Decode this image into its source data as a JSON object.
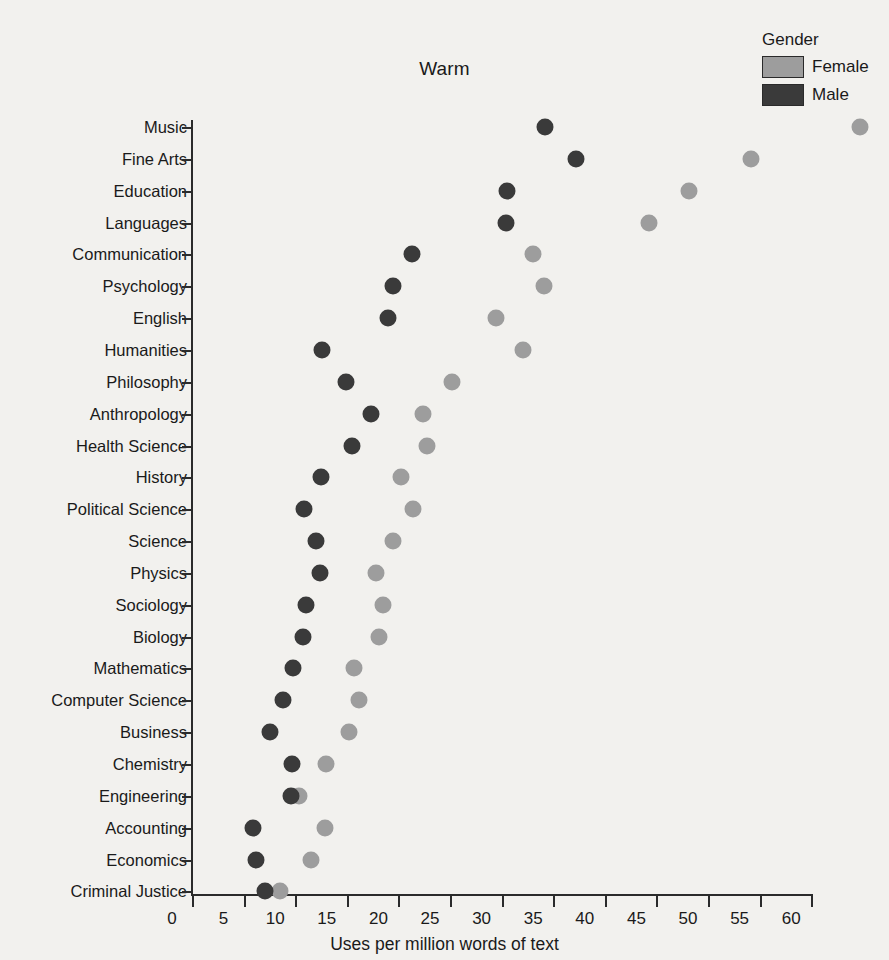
{
  "chart_data": {
    "type": "scatter",
    "title": "Warm",
    "xlabel": "Uses per million words of text",
    "ylabel": "",
    "xlim": [
      0,
      62
    ],
    "xticks": [
      0,
      5,
      10,
      15,
      20,
      25,
      30,
      35,
      40,
      45,
      50,
      55,
      60
    ],
    "grid": false,
    "legend": {
      "title": "Gender",
      "position": "top-right",
      "entries": [
        {
          "name": "Female",
          "color": "#9d9d9d"
        },
        {
          "name": "Male",
          "color": "#3a3a3a"
        }
      ]
    },
    "categories": [
      "Music",
      "Fine Arts",
      "Education",
      "Languages",
      "Communication",
      "Psychology",
      "English",
      "Humanities",
      "Philosophy",
      "Anthropology",
      "Health Science",
      "History",
      "Political Science",
      "Science",
      "Physics",
      "Sociology",
      "Biology",
      "Mathematics",
      "Computer Science",
      "Business",
      "Chemistry",
      "Engineering",
      "Accounting",
      "Economics",
      "Criminal Justice"
    ],
    "series": [
      {
        "name": "Female",
        "color": "#9d9d9d",
        "values": [
          64.7,
          54.2,
          48.2,
          44.3,
          33.0,
          34.1,
          29.5,
          32.1,
          25.2,
          22.4,
          22.8,
          20.3,
          21.4,
          19.5,
          17.8,
          18.5,
          18.1,
          15.7,
          16.2,
          15.2,
          13.0,
          10.4,
          12.9,
          11.5,
          8.5
        ]
      },
      {
        "name": "Male",
        "color": "#3a3a3a",
        "values": [
          34.2,
          37.2,
          30.5,
          30.4,
          21.3,
          19.5,
          19.0,
          12.6,
          14.9,
          17.3,
          15.5,
          12.5,
          10.9,
          12.0,
          12.4,
          11.0,
          10.8,
          9.8,
          8.8,
          7.6,
          9.7,
          9.6,
          5.9,
          6.2,
          7.1
        ]
      }
    ]
  }
}
